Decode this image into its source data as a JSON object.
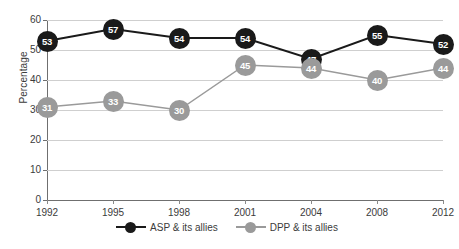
{
  "chart_data": {
    "type": "line",
    "title": "",
    "xlabel": "",
    "ylabel": "Percentage",
    "categories": [
      "1992",
      "1995",
      "1998",
      "2001",
      "2004",
      "2008",
      "2012"
    ],
    "series": [
      {
        "name": "ASP & its allies",
        "color": "#1a1a1a",
        "values": [
          53,
          57,
          54,
          54,
          47,
          55,
          52
        ]
      },
      {
        "name": "DPP & its allies",
        "color": "#9a9a9a",
        "values": [
          31,
          33,
          30,
          45,
          44,
          40,
          44
        ]
      }
    ],
    "ylim": [
      0,
      60
    ],
    "ytick_labels": [
      "0",
      "10",
      "20",
      "30",
      "40",
      "50",
      "60"
    ],
    "ytick_values": [
      0,
      10,
      20,
      30,
      40,
      50,
      60
    ],
    "grid": true,
    "data_labels": true,
    "legend_position": "bottom"
  },
  "legend": {
    "items": [
      {
        "label": "ASP & its allies",
        "marker": "filled-circle-black"
      },
      {
        "label": "DPP & its allies",
        "marker": "filled-circle-gray"
      }
    ]
  },
  "caption_fragment": ""
}
